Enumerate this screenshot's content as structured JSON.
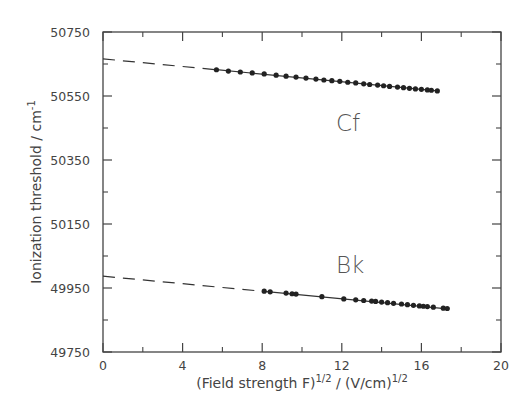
{
  "chart_data": {
    "type": "scatter",
    "title": "",
    "xlabel": "(Field strength F)^1/2 / (V/cm)^1/2",
    "ylabel": "Ionization threshold / cm^-1",
    "xlim": [
      0,
      20
    ],
    "ylim": [
      49750,
      50750
    ],
    "x_ticks": [
      0,
      4,
      8,
      12,
      16,
      20
    ],
    "x_minor_ticks": [
      2,
      6,
      10,
      14,
      18
    ],
    "y_ticks": [
      49750,
      49950,
      50150,
      50350,
      50550,
      50750
    ],
    "y_minor_ticks": [
      49850,
      50050,
      50250,
      50450,
      50650
    ],
    "grid": false,
    "legend": "none (inline text labels)",
    "series": [
      {
        "name": "Cf",
        "label_position": {
          "x": 14.9,
          "y": 50440
        },
        "fit": {
          "type": "linear",
          "intercept": 50666,
          "slope": -5.94,
          "extrapolation": "dashed from x=0 to first point"
        },
        "points": [
          {
            "x": 5.7,
            "y": 50632
          },
          {
            "x": 6.3,
            "y": 50628
          },
          {
            "x": 6.9,
            "y": 50625
          },
          {
            "x": 7.5,
            "y": 50622
          },
          {
            "x": 8.1,
            "y": 50619
          },
          {
            "x": 8.7,
            "y": 50615
          },
          {
            "x": 9.2,
            "y": 50612
          },
          {
            "x": 9.7,
            "y": 50609
          },
          {
            "x": 10.2,
            "y": 50606
          },
          {
            "x": 10.7,
            "y": 50603
          },
          {
            "x": 11.1,
            "y": 50600
          },
          {
            "x": 11.5,
            "y": 50598
          },
          {
            "x": 11.9,
            "y": 50596
          },
          {
            "x": 12.3,
            "y": 50593
          },
          {
            "x": 12.7,
            "y": 50591
          },
          {
            "x": 13.1,
            "y": 50588
          },
          {
            "x": 13.4,
            "y": 50586
          },
          {
            "x": 13.8,
            "y": 50584
          },
          {
            "x": 14.1,
            "y": 50582
          },
          {
            "x": 14.4,
            "y": 50580
          },
          {
            "x": 14.8,
            "y": 50578
          },
          {
            "x": 15.1,
            "y": 50576
          },
          {
            "x": 15.4,
            "y": 50574
          },
          {
            "x": 15.7,
            "y": 50572
          },
          {
            "x": 16.0,
            "y": 50571
          },
          {
            "x": 16.3,
            "y": 50569
          },
          {
            "x": 16.5,
            "y": 50568
          },
          {
            "x": 16.8,
            "y": 50566
          }
        ]
      },
      {
        "name": "Bk",
        "label_position": {
          "x": 14.9,
          "y": 50000
        },
        "fit": {
          "type": "linear",
          "intercept": 49987,
          "slope": -5.9,
          "extrapolation": "dashed from x=0 to first point"
        },
        "points": [
          {
            "x": 8.1,
            "y": 49940
          },
          {
            "x": 8.4,
            "y": 49938
          },
          {
            "x": 9.2,
            "y": 49934
          },
          {
            "x": 9.5,
            "y": 49932
          },
          {
            "x": 9.7,
            "y": 49931
          },
          {
            "x": 11.0,
            "y": 49923
          },
          {
            "x": 12.1,
            "y": 49916
          },
          {
            "x": 12.7,
            "y": 49913
          },
          {
            "x": 13.1,
            "y": 49911
          },
          {
            "x": 13.5,
            "y": 49909
          },
          {
            "x": 13.7,
            "y": 49908
          },
          {
            "x": 14.0,
            "y": 49906
          },
          {
            "x": 14.3,
            "y": 49904
          },
          {
            "x": 14.6,
            "y": 49902
          },
          {
            "x": 15.0,
            "y": 49900
          },
          {
            "x": 15.3,
            "y": 49898
          },
          {
            "x": 15.6,
            "y": 49896
          },
          {
            "x": 15.9,
            "y": 49894
          },
          {
            "x": 16.1,
            "y": 49893
          },
          {
            "x": 16.3,
            "y": 49892
          },
          {
            "x": 16.6,
            "y": 49890
          },
          {
            "x": 17.1,
            "y": 49887
          },
          {
            "x": 17.3,
            "y": 49886
          }
        ]
      }
    ]
  },
  "labels": {
    "y_axis_title": "Ionization threshold  /  cm",
    "y_axis_sup": "-1",
    "x_axis_title_1": "(Field strength F)",
    "x_axis_sup_1": "1/2",
    "x_axis_title_2": " / (V/cm)",
    "x_axis_sup_2": "1/2",
    "x_ticks": [
      "0",
      "4",
      "8",
      "12",
      "16",
      "20"
    ],
    "y_ticks": [
      "50750",
      "50550",
      "50350",
      "50150",
      "49950",
      "49750"
    ],
    "series": [
      "Cf",
      "Bk"
    ]
  },
  "colors": {
    "axis": "#444444",
    "points": "#222222",
    "line": "#333333",
    "text": "#444444"
  }
}
